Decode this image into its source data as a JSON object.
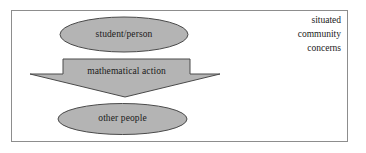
{
  "figure": {
    "type": "flow-diagram",
    "background_color": "#ffffff",
    "frame_border_color": "#8d8d8d",
    "shape_fill_color": "#b4b4b4",
    "shape_stroke_color": "#4a4a4a",
    "text_color": "#1a1a1a"
  },
  "nodes": {
    "top_ellipse": {
      "label": "student/person",
      "shape": "ellipse"
    },
    "arrow_banner": {
      "label": "mathematical action",
      "shape": "down-arrow"
    },
    "bottom_ellipse": {
      "label": "other people",
      "shape": "ellipse"
    }
  },
  "side_note": {
    "lines": [
      "situated",
      "community",
      "concerns"
    ]
  }
}
